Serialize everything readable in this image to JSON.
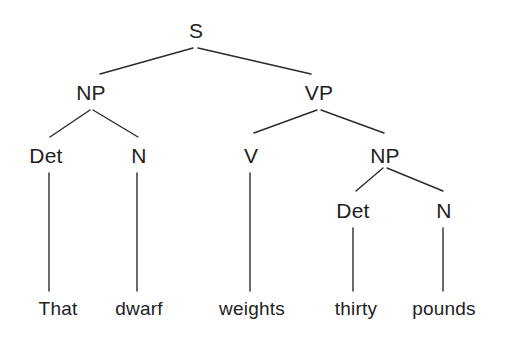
{
  "figure": {
    "type": "syntax-tree",
    "title": "",
    "sentence": "That dwarf weights thirty pounds",
    "background_color": "#ffffff",
    "line_color": "#2b2b2b",
    "text_color": "#222222"
  },
  "nodes": [
    {
      "id": "S",
      "label": "S",
      "kind": "category",
      "x": 196,
      "y": 30,
      "level": 0
    },
    {
      "id": "NP1",
      "label": "NP",
      "kind": "category",
      "x": 91,
      "y": 92,
      "level": 1
    },
    {
      "id": "VP",
      "label": "VP",
      "kind": "category",
      "x": 319,
      "y": 92,
      "level": 1
    },
    {
      "id": "DET1",
      "label": "Det",
      "kind": "category",
      "x": 46,
      "y": 155,
      "level": 2
    },
    {
      "id": "N1",
      "label": "N",
      "kind": "category",
      "x": 139,
      "y": 155,
      "level": 2
    },
    {
      "id": "V",
      "label": "V",
      "kind": "category",
      "x": 251,
      "y": 155,
      "level": 2
    },
    {
      "id": "NP2",
      "label": "NP",
      "kind": "category",
      "x": 385,
      "y": 155,
      "level": 2
    },
    {
      "id": "DET2",
      "label": "Det",
      "kind": "category",
      "x": 353,
      "y": 210,
      "level": 3
    },
    {
      "id": "N2",
      "label": "N",
      "kind": "category",
      "x": 444,
      "y": 210,
      "level": 3
    },
    {
      "id": "W1",
      "label": "That",
      "kind": "leaf",
      "x": 58,
      "y": 308,
      "level": 4
    },
    {
      "id": "W2",
      "label": "dwarf",
      "kind": "leaf",
      "x": 139,
      "y": 308,
      "level": 4
    },
    {
      "id": "W3",
      "label": "weights",
      "kind": "leaf",
      "x": 252,
      "y": 308,
      "level": 4
    },
    {
      "id": "W4",
      "label": "thirty",
      "kind": "leaf",
      "x": 356,
      "y": 308,
      "level": 4
    },
    {
      "id": "W5",
      "label": "pounds",
      "kind": "leaf",
      "x": 444,
      "y": 308,
      "level": 4
    }
  ],
  "edges": [
    {
      "id": "e-s-np1",
      "from": "S",
      "to": "NP1",
      "x1": 193,
      "y1": 48,
      "x2": 100,
      "y2": 74
    },
    {
      "id": "e-s-vp",
      "from": "S",
      "to": "VP",
      "x1": 198,
      "y1": 48,
      "x2": 311,
      "y2": 74
    },
    {
      "id": "e-np1-det1",
      "from": "NP1",
      "to": "DET1",
      "x1": 90,
      "y1": 110,
      "x2": 50,
      "y2": 137
    },
    {
      "id": "e-np1-n1",
      "from": "NP1",
      "to": "N1",
      "x1": 93,
      "y1": 110,
      "x2": 138,
      "y2": 137
    },
    {
      "id": "e-vp-v",
      "from": "VP",
      "to": "V",
      "x1": 317,
      "y1": 110,
      "x2": 254,
      "y2": 133
    },
    {
      "id": "e-vp-np2",
      "from": "VP",
      "to": "NP2",
      "x1": 321,
      "y1": 110,
      "x2": 384,
      "y2": 133
    },
    {
      "id": "e-np2-det2",
      "from": "NP2",
      "to": "DET2",
      "x1": 383,
      "y1": 168,
      "x2": 356,
      "y2": 191
    },
    {
      "id": "e-np2-n2",
      "from": "NP2",
      "to": "N2",
      "x1": 387,
      "y1": 168,
      "x2": 443,
      "y2": 191
    },
    {
      "id": "e-det1-w1",
      "from": "DET1",
      "to": "W1",
      "x1": 49,
      "y1": 173,
      "x2": 49,
      "y2": 291
    },
    {
      "id": "e-n1-w2",
      "from": "N1",
      "to": "W2",
      "x1": 137,
      "y1": 173,
      "x2": 137,
      "y2": 291
    },
    {
      "id": "e-v-w3",
      "from": "V",
      "to": "W3",
      "x1": 250,
      "y1": 173,
      "x2": 250,
      "y2": 291
    },
    {
      "id": "e-det2-w4",
      "from": "DET2",
      "to": "W4",
      "x1": 353,
      "y1": 228,
      "x2": 353,
      "y2": 291
    },
    {
      "id": "e-n2-w5",
      "from": "N2",
      "to": "W5",
      "x1": 443,
      "y1": 228,
      "x2": 443,
      "y2": 291
    }
  ]
}
